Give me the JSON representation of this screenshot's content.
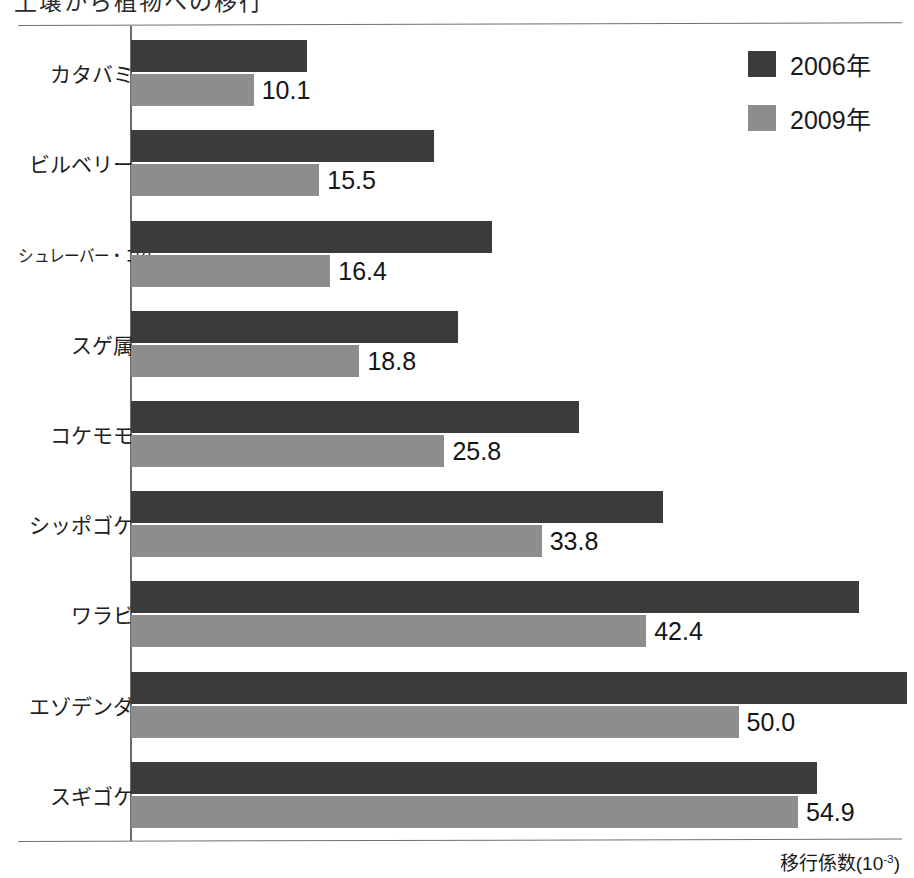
{
  "title_cropped": "土壌から植物への移行",
  "legend": {
    "items": [
      {
        "label": "2006年",
        "color": "#3b3b3b",
        "key": "2006"
      },
      {
        "label": "2009年",
        "color": "#8d8d8d",
        "key": "2009"
      }
    ]
  },
  "axis_caption": {
    "base": "移行係数(10",
    "exponent": "-3",
    "close": ")"
  },
  "chart_data": {
    "type": "bar",
    "orientation": "horizontal",
    "title": "",
    "xlabel": "移行係数(10-3)",
    "ylabel": "",
    "xlim": [
      0,
      64
    ],
    "grid": false,
    "legend_position": "top-right",
    "categories": [
      "カタバミ",
      "ビルベリー",
      "シュレーバー・コケ",
      "スゲ属",
      "コケモモ",
      "シッポゴケ",
      "ワラビ",
      "エゾデンダ",
      "スギゴケ"
    ],
    "series": [
      {
        "name": "2006年",
        "color": "#3b3b3b",
        "values": [
          14.5,
          24.9,
          29.7,
          26.9,
          36.9,
          43.8,
          59.9,
          64.0,
          56.5
        ],
        "labeled": false
      },
      {
        "name": "2009年",
        "color": "#8d8d8d",
        "values": [
          10.1,
          15.5,
          16.4,
          18.8,
          25.8,
          33.8,
          42.4,
          50.0,
          54.9
        ],
        "labeled": true,
        "labels": [
          "10.1",
          "15.5",
          "16.4",
          "18.8",
          "25.8",
          "33.8",
          "42.4",
          "50.0",
          "54.9"
        ]
      }
    ],
    "notes": {
      "2006_series_unlabeled": true,
      "ezodenda_2006_clipped_at_plot_edge": true
    }
  },
  "colors": {
    "series_2006": "#3b3b3b",
    "series_2009": "#8d8d8d",
    "rule": "#6f6f6f",
    "axis": "#6b6b6b",
    "background": "#ffffff"
  }
}
